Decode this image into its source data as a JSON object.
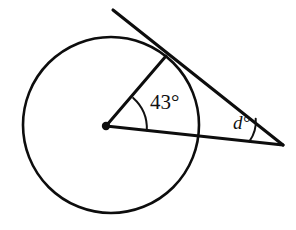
{
  "figure": {
    "background_color": "#ffffff",
    "stroke_color": "#0d0d0d",
    "width": 296,
    "height": 230
  },
  "circle": {
    "name": "circle",
    "center_x": 111,
    "center_y": 125,
    "radius": 88,
    "stroke_width": 2.6
  },
  "center_point": {
    "name": "circle-center",
    "x": 106,
    "y": 126,
    "dot_radius": 4.2
  },
  "tangent_point": {
    "name": "tangent-point",
    "x": 166,
    "y": 56
  },
  "external_vertex": {
    "name": "external-vertex",
    "x": 283,
    "y": 145
  },
  "tangent_line": {
    "name": "tangent-line",
    "x1": 113,
    "y1": 10,
    "x2": 283,
    "y2": 145,
    "stroke_width": 3.1
  },
  "radius_segment": {
    "name": "radius-to-tangent-point",
    "x1": 106,
    "y1": 126,
    "x2": 166,
    "y2": 56,
    "stroke_width": 3.0
  },
  "secant_segment": {
    "name": "center-to-external-vertex",
    "x1": 106,
    "y1": 126,
    "x2": 283,
    "y2": 145,
    "stroke_width": 3.1
  },
  "central_angle": {
    "name": "central-angle",
    "label": "43",
    "degree_symbol": "°",
    "value_text": "43°",
    "label_x": 150,
    "label_y": 104,
    "arc_radius": 41,
    "arc_stroke_width": 2.0
  },
  "external_angle": {
    "name": "external-angle",
    "label": "d",
    "degree_symbol": "°",
    "value_text": "d°",
    "label_x": 233,
    "label_y": 125,
    "arc_radius": 34,
    "arc_stroke_width": 2.0
  },
  "labels": {
    "central": "43°",
    "external": "d°"
  }
}
